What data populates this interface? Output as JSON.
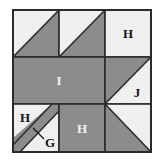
{
  "figure": {
    "type": "quilt-block-diagram",
    "title": "",
    "colors": {
      "light_fabric": "#efefef",
      "dark_fabric": "#8c8c8c",
      "outline": "#2b2b2b",
      "background": "#ffffff",
      "label_on_light": "#141414",
      "label_on_dark": "#f2f2f2"
    },
    "grid": {
      "rows": 3,
      "columns": 3,
      "origin_x": 13,
      "origin_y": 10,
      "cell_size": 46
    },
    "labels": {
      "top_right_h": "H",
      "center_i": "I",
      "right_j": "J",
      "bottom_left_h": "H",
      "bottom_left_g": "G",
      "bottom_center_h": "H"
    },
    "units": [
      {
        "id": "r1c1",
        "name": "half-square-triangle",
        "light_corner": "top-left",
        "dark_corner": "bottom-right",
        "label": ""
      },
      {
        "id": "r1c2",
        "name": "half-square-triangle",
        "light_corner": "top-left",
        "dark_corner": "bottom-right",
        "label": ""
      },
      {
        "id": "r1c3",
        "name": "plain-square",
        "fabric": "light",
        "label": "H"
      },
      {
        "id": "r2c1c2",
        "name": "plain-rectangle",
        "fabric": "dark",
        "span_columns": 2,
        "label": "I"
      },
      {
        "id": "r2c3",
        "name": "half-square-triangle",
        "dark_corner": "top-left",
        "light_corner": "bottom-right",
        "label": "J"
      },
      {
        "id": "r3c1",
        "name": "diagonal-strip-square",
        "fabric": "light",
        "strip_fabric": "dark",
        "strip_direction": "bottom-left-to-top-right",
        "label": "H",
        "callout": "G"
      },
      {
        "id": "r3c2",
        "name": "plain-square",
        "fabric": "dark",
        "label": "H"
      },
      {
        "id": "r3c3",
        "name": "half-square-triangle",
        "dark_corner": "bottom-left",
        "light_corner": "top-right",
        "label": ""
      }
    ]
  }
}
